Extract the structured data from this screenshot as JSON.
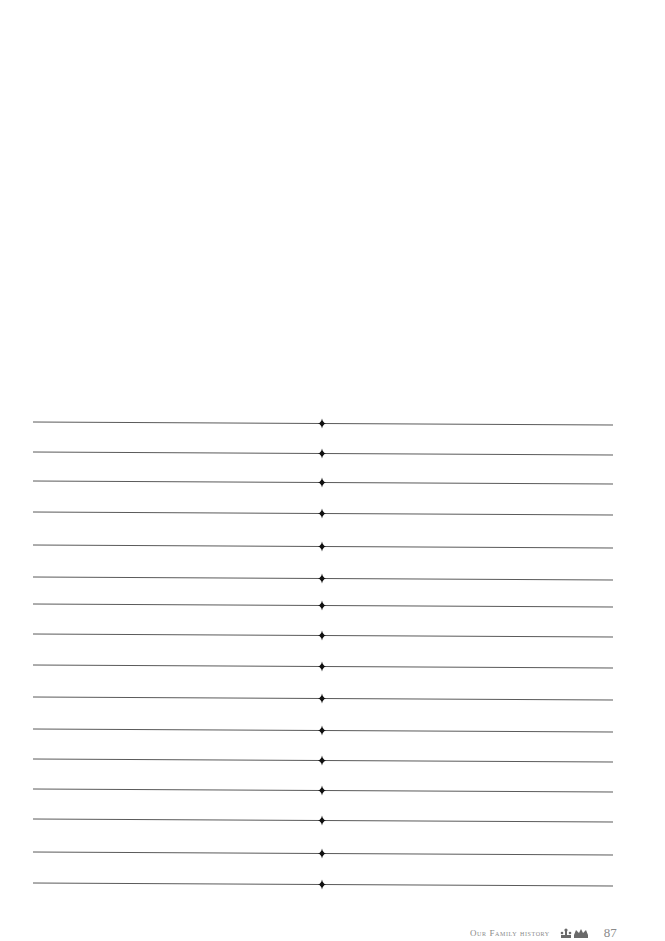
{
  "page": {
    "background": "#ffffff",
    "ruled_lines": {
      "count": 16,
      "left_x1": 33,
      "center_x": 322,
      "right_x2": 613,
      "left_y": [
        422,
        452,
        481,
        512,
        545,
        577,
        604,
        634,
        665,
        697,
        729,
        759,
        789,
        819,
        852,
        883
      ],
      "right_y": [
        425,
        455,
        484,
        515,
        548,
        580,
        607,
        637,
        668,
        700,
        732,
        762,
        792,
        822,
        855,
        886
      ],
      "line_color": "#5a5a5a",
      "divider_icon": "diamond-icon",
      "divider_color": "#111111"
    }
  },
  "footer": {
    "title": "Our Family history",
    "ornament_icon": "crown-ornament-icon",
    "page_number": "87"
  }
}
